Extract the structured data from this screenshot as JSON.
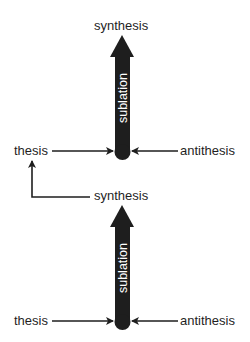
{
  "diagram": {
    "type": "dialectic-chain",
    "colors": {
      "arrow": "#1e1e1e",
      "text": "#1f1f1f",
      "background": "#ffffff",
      "arrow_text": "#ffffff"
    },
    "upper": {
      "synthesis": "synthesis",
      "process": "sublation",
      "thesis": "thesis",
      "antithesis": "antithesis"
    },
    "lower": {
      "synthesis": "synthesis",
      "process": "sublation",
      "thesis": "thesis",
      "antithesis": "antithesis"
    },
    "connector": {
      "from": "lower.synthesis",
      "to": "upper.thesis"
    }
  }
}
